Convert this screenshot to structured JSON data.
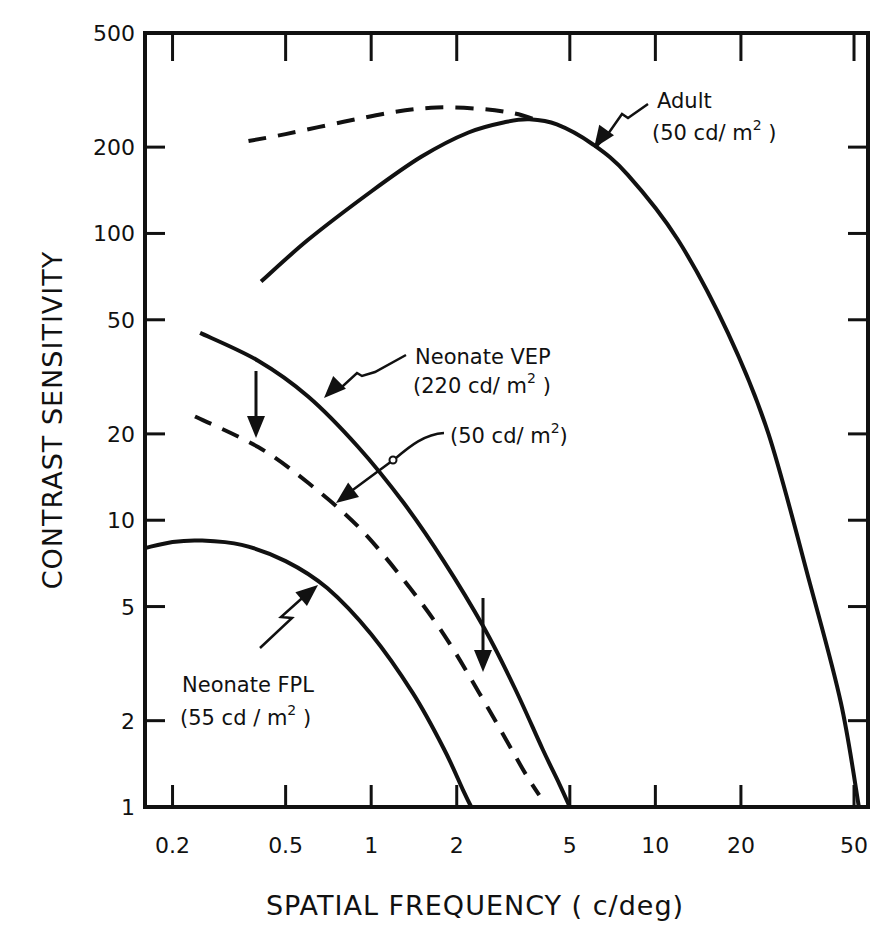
{
  "chart_data": {
    "type": "line",
    "title": "",
    "xlabel": "SPATIAL FREQUENCY (c/deg)",
    "ylabel": "CONTRAST SENSITIVITY",
    "xscale": "log",
    "yscale": "log",
    "xlim": [
      0.16,
      56
    ],
    "ylim": [
      1,
      500
    ],
    "grid": false,
    "x_ticks": [
      0.2,
      0.5,
      1,
      2,
      5,
      10,
      20,
      50
    ],
    "x_tick_labels": [
      "0.2",
      "0.5",
      "1",
      "2",
      "5",
      "10",
      "20",
      "50"
    ],
    "y_ticks": [
      1,
      2,
      5,
      10,
      20,
      50,
      100,
      200,
      500
    ],
    "y_tick_labels": [
      "1",
      "2",
      "5",
      "10",
      "20",
      "50",
      "100",
      "200",
      "500"
    ],
    "series": [
      {
        "name": "Adult (50 cd/m2)",
        "style": "solid",
        "x": [
          0.41,
          0.6,
          1.0,
          1.5,
          2.2,
          3.0,
          3.6,
          4.5,
          6,
          8,
          12,
          18,
          25,
          35,
          45,
          52
        ],
        "y": [
          68,
          95,
          140,
          185,
          225,
          245,
          250,
          240,
          205,
          160,
          95,
          45,
          20,
          6,
          2.3,
          1
        ]
      },
      {
        "name": "Adult (extrapolated)",
        "style": "dashed",
        "x": [
          0.37,
          0.5,
          0.8,
          1.2,
          1.7,
          2.4,
          3.2,
          4.0
        ],
        "y": [
          210,
          222,
          245,
          265,
          275,
          272,
          262,
          245
        ]
      },
      {
        "name": "Neonate VEP (220 cd/m2)",
        "style": "solid",
        "x": [
          0.25,
          0.4,
          0.6,
          0.9,
          1.3,
          1.8,
          2.5,
          3.2,
          4.0,
          4.6,
          5.0
        ],
        "y": [
          45,
          36,
          27,
          18,
          11.5,
          7.2,
          4.2,
          2.6,
          1.6,
          1.2,
          1
        ]
      },
      {
        "name": "Neonate VEP (50 cd/m2)",
        "style": "dashed",
        "x": [
          0.24,
          0.4,
          0.6,
          0.9,
          1.3,
          1.8,
          2.4,
          3.0,
          3.5,
          3.9
        ],
        "y": [
          23,
          18,
          13.5,
          9.5,
          6.2,
          4.0,
          2.5,
          1.7,
          1.3,
          1.1
        ]
      },
      {
        "name": "Neonate FPL (55 cd/m2)",
        "style": "solid",
        "x": [
          0.16,
          0.2,
          0.25,
          0.35,
          0.5,
          0.7,
          1.0,
          1.4,
          1.8,
          2.1,
          2.25
        ],
        "y": [
          8.0,
          8.4,
          8.5,
          8.2,
          7.2,
          5.8,
          4.0,
          2.5,
          1.6,
          1.15,
          1
        ]
      }
    ],
    "annotations": [
      {
        "text": "Adult",
        "text2": "(50 cd/m2)"
      },
      {
        "text": "Neonate VEP",
        "text2": "(220 cd/m2)"
      },
      {
        "text": "(50 cd/m2)"
      },
      {
        "text": "Neonate FPL",
        "text2": "(55 cd/m2)"
      },
      {
        "text": "down arrow at ~0.42 c/deg from VEP 220 to VEP 50 curve"
      },
      {
        "text": "down arrow at ~2.6 c/deg from VEP 220 to VEP 50 curve"
      }
    ]
  },
  "labels": {
    "x_axis_title": "SPATIAL FREQUENCY ( c/deg)",
    "y_axis_title": "CONTRAST SENSITIVITY",
    "adult_name": "Adult",
    "adult_lum_pre": "(50 cd/ m",
    "adult_lum_post": " )",
    "vep_name": "Neonate VEP",
    "vep_lum_pre": "(220 cd/ m",
    "vep_lum_post": " )",
    "vep50_lum_pre": "(50 cd/ m",
    "vep50_lum_post": ")",
    "fpl_name": "Neonate FPL",
    "fpl_lum_pre": "(55 cd / m",
    "fpl_lum_post": " )",
    "superscript": "2"
  }
}
